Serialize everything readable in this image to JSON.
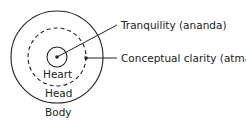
{
  "diagram": {
    "layers": [
      {
        "label": "Heart",
        "style": "solid"
      },
      {
        "label": "Head",
        "style": "dashed"
      },
      {
        "label": "Body",
        "style": "solid"
      }
    ],
    "callouts": [
      {
        "label": "Tranquility (ananda)",
        "target": "Heart"
      },
      {
        "label": "Conceptual clarity (atma)",
        "target": "Head"
      }
    ],
    "colors": {
      "stroke": "#222222",
      "background": "#ffffff"
    }
  }
}
